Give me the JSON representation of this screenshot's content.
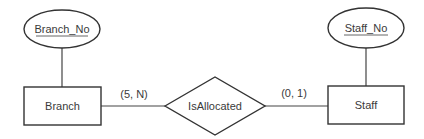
{
  "diagram": {
    "type": "ER diagram",
    "entities": [
      {
        "id": "branch",
        "label": "Branch",
        "key_attribute": "Branch_No"
      },
      {
        "id": "staff",
        "label": "Staff",
        "key_attribute": "Staff_No"
      }
    ],
    "relationship": {
      "label": "IsAllocated",
      "left_cardinality": "(5, N)",
      "right_cardinality": "(0, 1)"
    }
  },
  "colors": {
    "stroke": "#333333",
    "text": "#3a3a3a",
    "background": "#ffffff"
  }
}
